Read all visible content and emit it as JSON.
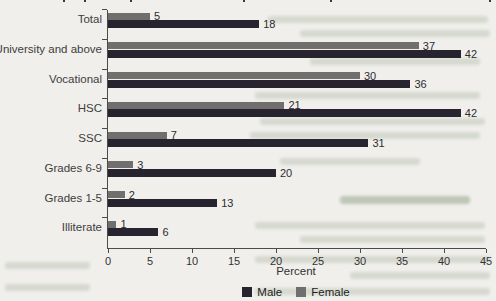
{
  "chart_data": {
    "type": "bar",
    "orientation": "horizontal",
    "title": "",
    "xlabel": "Percent",
    "xlim": [
      0,
      45
    ],
    "xticks": [
      0,
      5,
      10,
      15,
      20,
      25,
      30,
      35,
      40,
      45
    ],
    "grid": false,
    "legend_position": "bottom-center",
    "categories": [
      "Total",
      "University and above",
      "Vocational",
      "HSC",
      "SSC",
      "Grades 6-9",
      "Grades 1-5",
      "Illiterate"
    ],
    "series": [
      {
        "name": "Female",
        "color": "#716f6d",
        "values": [
          5,
          37,
          30,
          21,
          7,
          3,
          2,
          1
        ]
      },
      {
        "name": "Male",
        "color": "#272430",
        "values": [
          18,
          42,
          36,
          42,
          31,
          20,
          13,
          6
        ]
      }
    ],
    "legend_order": [
      "Male",
      "Female"
    ]
  },
  "colors": {
    "paper": "#f0efec",
    "axis": "#4b4b4b",
    "tick_text": "#333333",
    "category_text": "#3d3d3d",
    "value_text": "#2c2c2c",
    "male": "#272430",
    "female": "#716f6d"
  }
}
